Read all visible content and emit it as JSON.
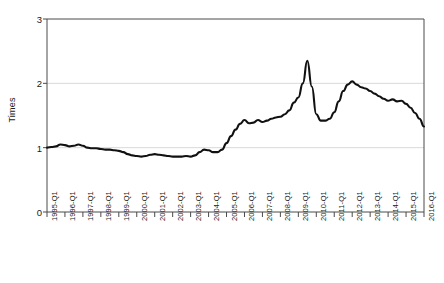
{
  "chart_data": {
    "type": "line",
    "title": "",
    "xlabel": "",
    "ylabel": "Times",
    "ylim": [
      0,
      3
    ],
    "yticks": [
      0,
      1,
      2,
      3
    ],
    "ytick_labels": [
      "0",
      "1",
      "2",
      "3"
    ],
    "grid": "horizontal",
    "legend": "none",
    "line_color": "#111111",
    "categories": [
      "1995-Q1",
      "1996-Q1",
      "1997-Q1",
      "1998-Q1",
      "1999-Q1",
      "2000-Q1",
      "2001-Q1",
      "2002-Q1",
      "2003-Q1",
      "2004-Q1",
      "2005-Q1",
      "2006-Q1",
      "2007-Q1",
      "2008-Q1",
      "2009-Q1",
      "2010-Q1",
      "2011-Q1",
      "2012-Q1",
      "2013-Q1",
      "2014-Q1",
      "2015-Q1",
      "2016-Q1"
    ],
    "series": [
      {
        "name": "Times",
        "x": [
          "1995-Q1",
          "1995-Q2",
          "1995-Q3",
          "1995-Q4",
          "1996-Q1",
          "1996-Q2",
          "1996-Q3",
          "1996-Q4",
          "1997-Q1",
          "1997-Q2",
          "1997-Q3",
          "1997-Q4",
          "1998-Q1",
          "1998-Q2",
          "1998-Q3",
          "1998-Q4",
          "1999-Q1",
          "1999-Q2",
          "1999-Q3",
          "1999-Q4",
          "2000-Q1",
          "2000-Q2",
          "2000-Q3",
          "2000-Q4",
          "2001-Q1",
          "2001-Q2",
          "2001-Q3",
          "2001-Q4",
          "2002-Q1",
          "2002-Q2",
          "2002-Q3",
          "2002-Q4",
          "2003-Q1",
          "2003-Q2",
          "2003-Q3",
          "2003-Q4",
          "2004-Q1",
          "2004-Q2",
          "2004-Q3",
          "2004-Q4",
          "2005-Q1",
          "2005-Q2",
          "2005-Q3",
          "2005-Q4",
          "2006-Q1",
          "2006-Q2",
          "2006-Q3",
          "2006-Q4",
          "2007-Q1",
          "2007-Q2",
          "2007-Q3",
          "2007-Q4",
          "2008-Q1",
          "2008-Q2",
          "2008-Q3",
          "2008-Q4",
          "2009-Q1",
          "2009-Q2",
          "2009-Q3",
          "2009-Q4",
          "2010-Q1",
          "2010-Q2",
          "2010-Q3",
          "2010-Q4",
          "2011-Q1",
          "2011-Q2",
          "2011-Q3",
          "2011-Q4",
          "2012-Q1",
          "2012-Q2",
          "2012-Q3",
          "2012-Q4",
          "2013-Q1",
          "2013-Q2",
          "2013-Q3",
          "2013-Q4",
          "2014-Q1",
          "2014-Q2",
          "2014-Q3",
          "2014-Q4",
          "2015-Q1",
          "2015-Q2",
          "2015-Q3",
          "2015-Q4",
          "2016-Q1"
        ],
        "values": [
          1.0,
          1.01,
          1.02,
          1.05,
          1.04,
          1.02,
          1.03,
          1.05,
          1.03,
          1.0,
          0.99,
          0.99,
          0.98,
          0.97,
          0.97,
          0.96,
          0.95,
          0.93,
          0.9,
          0.88,
          0.87,
          0.86,
          0.87,
          0.89,
          0.9,
          0.89,
          0.88,
          0.87,
          0.86,
          0.86,
          0.86,
          0.87,
          0.86,
          0.88,
          0.93,
          0.97,
          0.96,
          0.93,
          0.93,
          0.97,
          1.07,
          1.18,
          1.28,
          1.37,
          1.43,
          1.38,
          1.39,
          1.43,
          1.4,
          1.42,
          1.45,
          1.47,
          1.48,
          1.52,
          1.58,
          1.7,
          1.78,
          2.0,
          2.35,
          1.95,
          1.52,
          1.42,
          1.42,
          1.45,
          1.55,
          1.72,
          1.88,
          1.98,
          2.03,
          1.98,
          1.94,
          1.92,
          1.88,
          1.84,
          1.8,
          1.76,
          1.73,
          1.75,
          1.72,
          1.73,
          1.68,
          1.62,
          1.54,
          1.45,
          1.33
        ]
      }
    ],
    "annotations": []
  }
}
